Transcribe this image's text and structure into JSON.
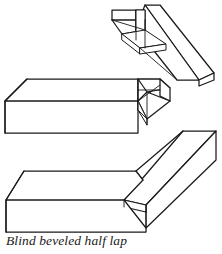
{
  "figure": {
    "caption": "Blind beveled half lap",
    "title": "Blind beveled half lap",
    "line_color": "#1a1a1a",
    "fill_color": "#ffffff",
    "background_color": "#ffffff",
    "style": "isometric line drawing",
    "parts": [
      {
        "name": "upper-board",
        "label": "Upper board with blind beveled notch",
        "position": "top-right"
      },
      {
        "name": "middle-board",
        "label": "Wide board with beveled half lap tongue",
        "position": "middle-left"
      },
      {
        "name": "lower-board",
        "label": "Wide board with rabbeted blind lap seat",
        "position": "bottom"
      }
    ]
  }
}
